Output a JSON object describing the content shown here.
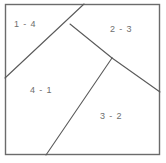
{
  "figure": {
    "background_color": "#ffffff",
    "border_color": "#6b6b6b",
    "line_color": "#5a5a5a",
    "label_color": "#6e6e6e",
    "frame": {
      "x": 5,
      "y": 4,
      "width": 155,
      "height": 151
    },
    "regions": [
      {
        "id": "region-top-left",
        "label": "1 - 4",
        "label_x": 14,
        "label_y": 20
      },
      {
        "id": "region-top-right",
        "label": "2 - 3",
        "label_x": 110,
        "label_y": 25
      },
      {
        "id": "region-bottom-left",
        "label": "4 - 1",
        "label_x": 30,
        "label_y": 86
      },
      {
        "id": "region-bottom-right",
        "label": "3 - 2",
        "label_x": 100,
        "label_y": 112
      }
    ],
    "vertices": {
      "junction_upper": {
        "x": 70,
        "y": 24
      },
      "junction_middle": {
        "x": 112,
        "y": 58
      },
      "left_edge_hit": {
        "x": 5,
        "y": 78
      },
      "top_edge_hit": {
        "x": 84,
        "y": 4
      },
      "right_edge_hit": {
        "x": 160,
        "y": 92
      },
      "bottom_edge_hit": {
        "x": 46,
        "y": 155
      }
    },
    "segments": [
      {
        "name": "segment-left-to-top",
        "x1": 5,
        "y1": 78,
        "x2": 84,
        "y2": 4
      },
      {
        "name": "segment-upper-to-middle",
        "x1": 70,
        "y1": 24,
        "x2": 112,
        "y2": 58
      },
      {
        "name": "segment-middle-to-right",
        "x1": 112,
        "y1": 58,
        "x2": 160,
        "y2": 92
      },
      {
        "name": "segment-middle-to-bottom",
        "x1": 112,
        "y1": 58,
        "x2": 46,
        "y2": 155
      }
    ]
  }
}
